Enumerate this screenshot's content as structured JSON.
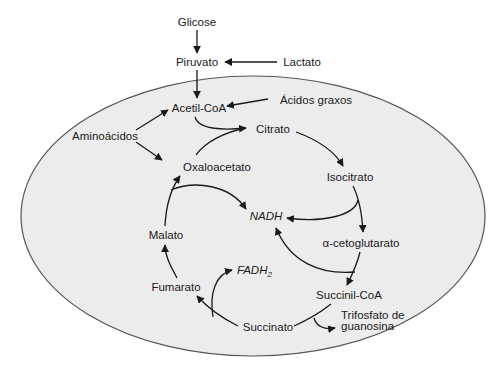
{
  "diagram": {
    "type": "metabolic-cycle",
    "container": {
      "shape": "ellipse",
      "fill": "#ececec",
      "stroke": "#555555"
    },
    "outside": {
      "glicose": "Glicose",
      "piruvato": "Piruvato",
      "lactato": "Lactato"
    },
    "inputs": {
      "acetil_coa": "Acetil-CoA",
      "acidos_graxos": "Ácidos graxos",
      "aminoacidos": "Aminoácidos"
    },
    "cycle": {
      "citrato": "Citrato",
      "isocitrato": "Isocitrato",
      "alfa_cetoglutarato": "α-cetoglutarato",
      "succinil_coa": "Succinil-CoA",
      "succinato": "Succinato",
      "fumarato": "Fumarato",
      "malato": "Malato",
      "oxaloacetato": "Oxaloacetato"
    },
    "products": {
      "nadh": "NADH",
      "fadh": "FADH",
      "fadh_sub": "2",
      "gtp_line1": "Trifosfato de",
      "gtp_line2": "guanosina"
    },
    "edges": [
      {
        "from": "Glicose",
        "to": "Piruvato"
      },
      {
        "from": "Lactato",
        "to": "Piruvato"
      },
      {
        "from": "Piruvato",
        "to": "Acetil-CoA"
      },
      {
        "from": "Ácidos graxos",
        "to": "Acetil-CoA"
      },
      {
        "from": "Aminoácidos",
        "to": "Acetil-CoA"
      },
      {
        "from": "Aminoácidos",
        "to": "Oxaloacetato"
      },
      {
        "from": "Acetil-CoA",
        "to": "Citrato"
      },
      {
        "from": "Oxaloacetato",
        "to": "Citrato"
      },
      {
        "from": "Citrato",
        "to": "Isocitrato"
      },
      {
        "from": "Isocitrato",
        "to": "α-cetoglutarato"
      },
      {
        "from": "Isocitrato",
        "to": "NADH"
      },
      {
        "from": "α-cetoglutarato",
        "to": "Succinil-CoA"
      },
      {
        "from": "α-cetoglutarato",
        "to": "NADH"
      },
      {
        "from": "Succinil-CoA",
        "to": "Succinato"
      },
      {
        "from": "Succinil-CoA",
        "to": "Trifosfato de guanosina"
      },
      {
        "from": "Succinato",
        "to": "Fumarato"
      },
      {
        "from": "Succinato",
        "to": "FADH2"
      },
      {
        "from": "Fumarato",
        "to": "Malato"
      },
      {
        "from": "Malato",
        "to": "Oxaloacetato"
      },
      {
        "from": "Malato",
        "to": "NADH"
      }
    ]
  }
}
